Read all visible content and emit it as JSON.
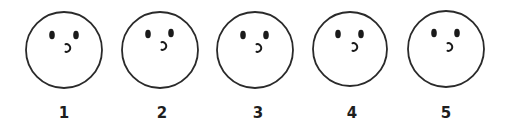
{
  "figure": {
    "background": "#ffffff",
    "stroke_color": "#2a2a2a",
    "feature_color": "#1a1a1a",
    "faces": [
      {
        "label": "1",
        "cx": 64,
        "cy": 50,
        "r": 38,
        "left_eye": {
          "cx": 52,
          "cy": 35
        },
        "right_eye": {
          "cx": 76,
          "cy": 35
        },
        "mouth": {
          "cx": 68,
          "cy": 48
        },
        "label_x": 64,
        "label_y": 105
      },
      {
        "label": "2",
        "cx": 160,
        "cy": 50,
        "r": 38,
        "left_eye": {
          "cx": 148,
          "cy": 34
        },
        "right_eye": {
          "cx": 171,
          "cy": 33
        },
        "mouth": {
          "cx": 164,
          "cy": 46
        },
        "label_x": 162,
        "label_y": 105
      },
      {
        "label": "3",
        "cx": 255,
        "cy": 50,
        "r": 38,
        "left_eye": {
          "cx": 243,
          "cy": 35
        },
        "right_eye": {
          "cx": 266,
          "cy": 35
        },
        "mouth": {
          "cx": 259,
          "cy": 48
        },
        "label_x": 258,
        "label_y": 105
      },
      {
        "label": "4",
        "cx": 350,
        "cy": 49,
        "r": 37,
        "left_eye": {
          "cx": 338,
          "cy": 34
        },
        "right_eye": {
          "cx": 361,
          "cy": 34
        },
        "mouth": {
          "cx": 355,
          "cy": 47
        },
        "label_x": 352,
        "label_y": 105
      },
      {
        "label": "5",
        "cx": 446,
        "cy": 49,
        "r": 38,
        "left_eye": {
          "cx": 434,
          "cy": 33
        },
        "right_eye": {
          "cx": 457,
          "cy": 33
        },
        "mouth": {
          "cx": 450,
          "cy": 47
        },
        "label_x": 446,
        "label_y": 105
      }
    ]
  }
}
